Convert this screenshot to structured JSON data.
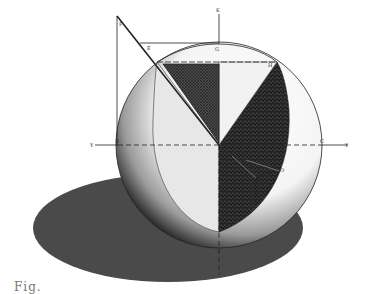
{
  "diagram": {
    "labels": {
      "K": "K",
      "F": "F",
      "E": "E",
      "G": "G",
      "H": "H",
      "C": "C",
      "D": "D",
      "P": "P",
      "O": "O",
      "R": "R",
      "Y_left": "Y",
      "Y_right": "Y"
    },
    "caption": "Fig."
  },
  "colors": {
    "ink": "#1a1a1a",
    "shadow": "#4a4a4a",
    "triangle_fill": "#3c3c3c",
    "dark_sector": "#1e1e1e",
    "light_hatch": "#d6d6d6",
    "background": "#ffffff"
  }
}
